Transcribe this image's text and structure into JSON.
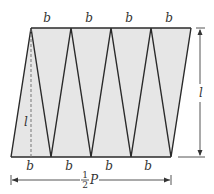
{
  "diagram": {
    "colors": {
      "fill": "#e6e6e6",
      "stroke": "#2a2a2a",
      "text": "#333333"
    },
    "top_labels": [
      "b",
      "b",
      "b",
      "b"
    ],
    "bottom_labels": [
      "b",
      "b",
      "b",
      "b"
    ],
    "height_label_inner": "l",
    "height_label_right": "l",
    "width_label": {
      "numerator": "1",
      "denominator": "2",
      "variable": "P"
    },
    "top_vertices_x": [
      31,
      71,
      111,
      151,
      191
    ],
    "bottom_vertices_x": [
      11,
      51,
      91,
      131,
      171
    ],
    "top_y": 28,
    "bottom_y": 157
  }
}
